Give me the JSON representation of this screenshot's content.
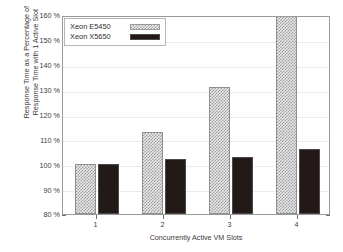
{
  "chart_data": {
    "type": "bar",
    "title": "",
    "subtitle": "",
    "xlabel": "Concurrently Active VM Slots",
    "ylabel": "Response Time as a Percentage of\nResponse Time with 1 Active Slot",
    "categories": [
      "1",
      "2",
      "3",
      "4"
    ],
    "series": [
      {
        "name": "Xeon E5450",
        "values": [
          100,
          113,
          131,
          168
        ],
        "pattern": "checkered",
        "color": "#e9e9e9",
        "clipped_points": [
          3
        ]
      },
      {
        "name": "Xeon X5650",
        "values": [
          100,
          102,
          103,
          106
        ],
        "pattern": "solid",
        "color": "#231a18",
        "clipped_points": []
      }
    ],
    "ylim": [
      80,
      160
    ],
    "ytick_values": [
      80,
      90,
      100,
      110,
      120,
      130,
      140,
      150,
      160
    ],
    "ytick_labels": [
      "80 %",
      "90 %",
      "100 %",
      "110 %",
      "120 %",
      "130 %",
      "140 %",
      "150 %",
      "160 %"
    ],
    "xtick_labels": [
      "1",
      "2",
      "3",
      "4"
    ],
    "grid": true,
    "grid_axis": "y",
    "legend": [
      "Xeon E5450",
      "Xeon X5650"
    ],
    "legend_position": "top-left-inside"
  },
  "axes": {
    "y_title": "Response Time as a Percentage of\nResponse Time with 1 Active Slot",
    "x_title": "Concurrently Active VM Slots"
  },
  "legend": {
    "entries": [
      {
        "label": "Xeon E5450",
        "swatch": "checkered-pattern-swatch"
      },
      {
        "label": "Xeon X5650",
        "swatch": "solid-dark-swatch"
      }
    ]
  }
}
